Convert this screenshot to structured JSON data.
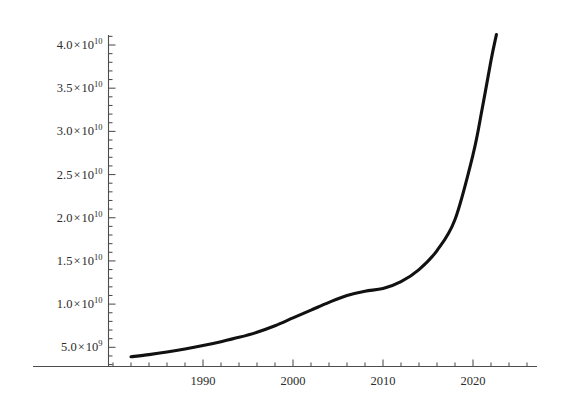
{
  "chart_data": {
    "type": "line",
    "title": "",
    "subtitle": "",
    "xlabel": "",
    "ylabel": "",
    "xlim": [
      1982,
      2023.5
    ],
    "ylim": [
      3600000000,
      41500000000
    ],
    "grid": false,
    "legend": "none",
    "curve_color": "#111111",
    "axis_color": "#555555",
    "background": "#ffffff",
    "y_tick_values": [
      5000000000,
      10000000000,
      15000000000,
      20000000000,
      25000000000,
      30000000000,
      35000000000,
      40000000000
    ],
    "y_tick_labels": [
      {
        "mantissa": "5.0",
        "times": "×",
        "base": "10",
        "exponent": "9",
        "text": "5.0×10⁹"
      },
      {
        "mantissa": "1.0",
        "times": "×",
        "base": "10",
        "exponent": "10",
        "text": "1.0×10¹⁰"
      },
      {
        "mantissa": "1.5",
        "times": "×",
        "base": "10",
        "exponent": "10",
        "text": "1.5×10¹⁰"
      },
      {
        "mantissa": "2.0",
        "times": "×",
        "base": "10",
        "exponent": "10",
        "text": "2.0×10¹⁰"
      },
      {
        "mantissa": "2.5",
        "times": "×",
        "base": "10",
        "exponent": "10",
        "text": "2.5×10¹⁰"
      },
      {
        "mantissa": "3.0",
        "times": "×",
        "base": "10",
        "exponent": "10",
        "text": "3.0×10¹⁰"
      },
      {
        "mantissa": "3.5",
        "times": "×",
        "base": "10",
        "exponent": "10",
        "text": "3.5×10¹⁰"
      },
      {
        "mantissa": "4.0",
        "times": "×",
        "base": "10",
        "exponent": "10",
        "text": "4.0×10¹⁰"
      }
    ],
    "y_minor_ticks_per_major": 5,
    "x_tick_values": [
      1990,
      2000,
      2010,
      2020
    ],
    "x_tick_labels": [
      "1990",
      "2000",
      "2010",
      "2020"
    ],
    "x_minor_tick_step": 2,
    "x": [
      1982,
      1984,
      1986,
      1988,
      1990,
      1992,
      1994,
      1996,
      1998,
      2000,
      2002,
      2004,
      2006,
      2008,
      2010,
      2012,
      2014,
      2016,
      2018,
      2020,
      2021,
      2022,
      2022.6
    ],
    "y": [
      3900000000,
      4150000000,
      4450000000,
      4800000000,
      5200000000,
      5650000000,
      6150000000,
      6750000000,
      7500000000,
      8400000000,
      9300000000,
      10200000000,
      11000000000,
      11500000000,
      11800000000,
      12600000000,
      14000000000,
      16200000000,
      19800000000,
      27300000000,
      32500000000,
      38200000000,
      41200000000
    ],
    "series": [
      {
        "name": "value",
        "values": [
          3900000000,
          4150000000,
          4450000000,
          4800000000,
          5200000000,
          5650000000,
          6150000000,
          6750000000,
          7500000000,
          8400000000,
          9300000000,
          10200000000,
          11000000000,
          11500000000,
          11800000000,
          12600000000,
          14000000000,
          16200000000,
          19800000000,
          27300000000,
          32500000000,
          38200000000,
          41200000000
        ]
      }
    ],
    "annotations": []
  },
  "axes": {
    "y_axis_name": "y-axis",
    "x_axis_name": "x-axis"
  }
}
